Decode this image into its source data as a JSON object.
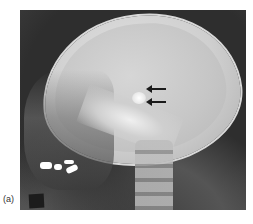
{
  "figure": {
    "panel_label": "(a)",
    "image_description": "Lateral skull radiograph",
    "annotations": [
      {
        "type": "arrow",
        "direction": "left",
        "color": "#1a1a1a"
      },
      {
        "type": "arrow",
        "direction": "left",
        "color": "#1a1a1a"
      }
    ],
    "colors": {
      "background": "#ffffff",
      "film_dark": "#2e2e2e",
      "bone_light": "#e2e2e2",
      "marker": "#1c1c1c"
    }
  }
}
